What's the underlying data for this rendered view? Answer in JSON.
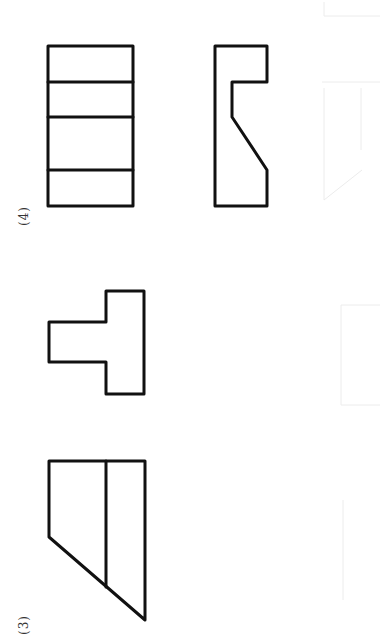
{
  "figures": [
    {
      "label": "(4)",
      "views": [
        {
          "name": "front-view",
          "shape": "rectangle-with-horizontal-divisions",
          "divisions": 3
        },
        {
          "name": "side-view",
          "shape": "notched-profile-with-chamfer"
        }
      ]
    },
    {
      "label": "(3)",
      "views": [
        {
          "name": "top-view",
          "shape": "t-shape"
        },
        {
          "name": "front-view",
          "shape": "trapezoid-with-vertical-line"
        }
      ]
    }
  ],
  "colors": {
    "line": "#111111",
    "background": "#ffffff",
    "label": "#333333"
  }
}
